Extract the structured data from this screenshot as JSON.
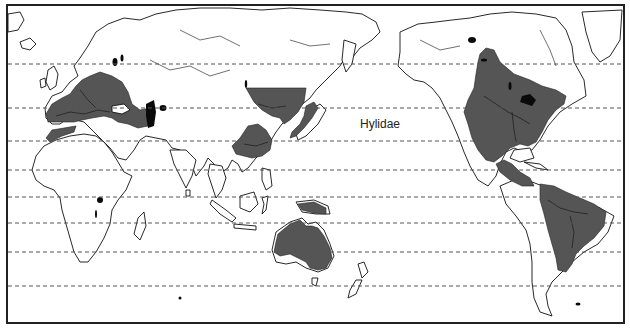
{
  "map": {
    "title": "Hylidae",
    "type": "world distribution map",
    "projection_center": "Pacific",
    "range_color": "#555555",
    "lake_color": "#0a0a0a",
    "land_outline_color": "#111111",
    "latitude_lines_y": [
      64,
      108,
      141,
      170,
      197,
      223,
      252,
      286
    ],
    "distribution_regions": [
      "Europe and Mediterranean",
      "North Africa coast",
      "Northeast China and Korea",
      "Japan",
      "South China",
      "New Guinea",
      "Australia",
      "North America",
      "Central America",
      "South America"
    ]
  }
}
